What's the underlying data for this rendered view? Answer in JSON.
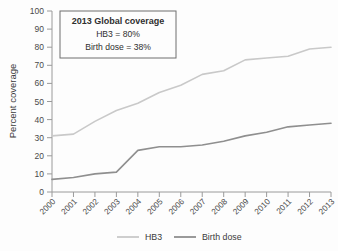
{
  "chart_data": {
    "type": "line",
    "title": "",
    "xlabel": "",
    "ylabel": "Percent coverage",
    "ylim": [
      0,
      100
    ],
    "yticks": [
      "0",
      "10",
      "20",
      "30",
      "40",
      "50",
      "60",
      "70",
      "80",
      "90",
      "100"
    ],
    "grid": false,
    "legend_position": "bottom",
    "categories": [
      "2000",
      "2001",
      "2002",
      "2003",
      "2004",
      "2005",
      "2006",
      "2007",
      "2008",
      "2009",
      "2010",
      "2011",
      "2012",
      "2013"
    ],
    "series": [
      {
        "name": "HB3",
        "color": "#c9c9c9",
        "values": [
          31,
          32,
          39,
          45,
          49,
          55,
          59,
          65,
          67,
          73,
          74,
          75,
          79,
          80
        ]
      },
      {
        "name": "Birth dose",
        "color": "#8f8f8f",
        "values": [
          7,
          8,
          10,
          11,
          23,
          25,
          25,
          26,
          28,
          31,
          33,
          36,
          37,
          38
        ]
      }
    ],
    "annotation": {
      "title": "2013 Global coverage",
      "lines": [
        "HB3 = 80%",
        "Birth dose = 38%"
      ]
    }
  },
  "legend": {
    "items": [
      {
        "label": "HB3"
      },
      {
        "label": "Birth dose"
      }
    ]
  },
  "axes": {
    "y_title": "Percent coverage"
  }
}
